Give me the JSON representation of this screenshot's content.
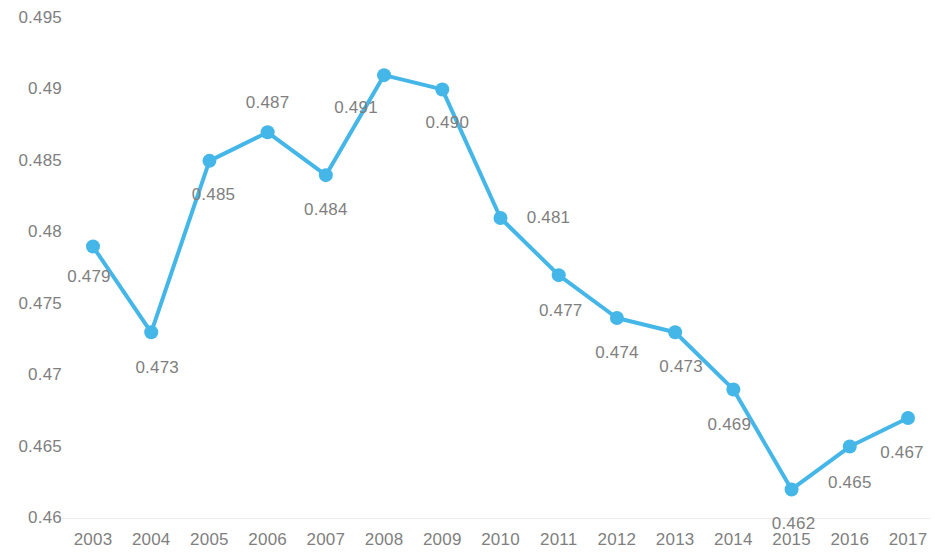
{
  "chart_data": {
    "type": "line",
    "title": "",
    "subtitle": "",
    "xlabel": "",
    "ylabel": "",
    "categories": [
      "2003",
      "2004",
      "2005",
      "2006",
      "2007",
      "2008",
      "2009",
      "2010",
      "2011",
      "2012",
      "2013",
      "2014",
      "2015",
      "2016",
      "2017"
    ],
    "values": [
      0.479,
      0.473,
      0.485,
      0.487,
      0.484,
      0.491,
      0.49,
      0.481,
      0.477,
      0.474,
      0.473,
      0.469,
      0.462,
      0.465,
      0.467
    ],
    "point_labels": [
      "0.479",
      "0.473",
      "0.485",
      "0.487",
      "0.484",
      "0.491",
      "0.490",
      "0.481",
      "0.477",
      "0.474",
      "0.473",
      "0.469",
      "0.462",
      "0.465",
      "0.467"
    ],
    "label_offsets": [
      {
        "dx": -4,
        "dy": 30
      },
      {
        "dx": 6,
        "dy": 36
      },
      {
        "dx": 4,
        "dy": 34
      },
      {
        "dx": 0,
        "dy": -29
      },
      {
        "dx": 0,
        "dy": 35
      },
      {
        "dx": -28,
        "dy": 33
      },
      {
        "dx": 5,
        "dy": 34
      },
      {
        "dx": 48,
        "dy": 0
      },
      {
        "dx": 2,
        "dy": 36
      },
      {
        "dx": 0,
        "dy": 35
      },
      {
        "dx": 6,
        "dy": 35
      },
      {
        "dx": -4,
        "dy": 36
      },
      {
        "dx": 2,
        "dy": 35
      },
      {
        "dx": 0,
        "dy": 36
      },
      {
        "dx": -6,
        "dy": 35
      }
    ],
    "y_ticks": [
      0.46,
      0.465,
      0.47,
      0.475,
      0.48,
      0.485,
      0.49,
      0.495
    ],
    "y_tick_labels": [
      "0.46",
      "0.465",
      "0.47",
      "0.475",
      "0.48",
      "0.485",
      "0.49",
      "0.495"
    ],
    "ylim": [
      0.46,
      0.495
    ],
    "grid": false,
    "legend": null,
    "series_color": "#45b6e8",
    "axis_text_color": "#7f7f7f",
    "baseline_color": "#ececec",
    "marker_radius": 7,
    "line_width": 4
  }
}
